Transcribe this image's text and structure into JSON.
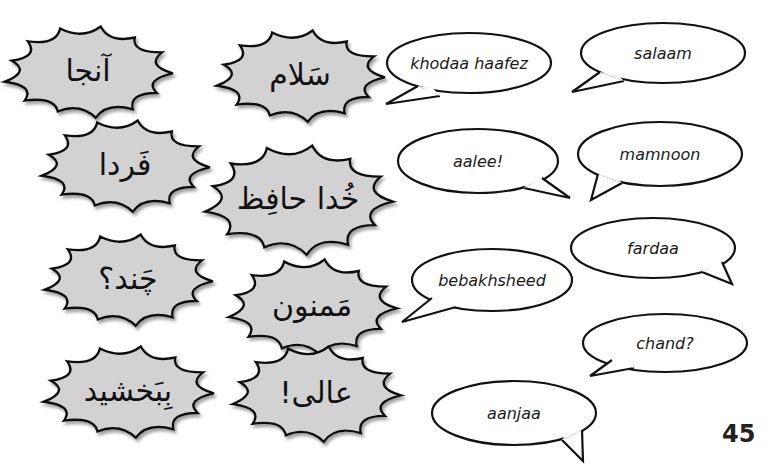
{
  "page": {
    "number": "45",
    "colors": {
      "burst_fill": "#d2d2d2",
      "burst_stroke": "#111111",
      "bubble_fill": "#ffffff",
      "bubble_stroke": "#111111",
      "shadow": "#9a9a9a"
    }
  },
  "farsi_words": [
    {
      "id": "aanjaa",
      "text": "آنجا",
      "cx": 88,
      "cy": 72,
      "w": 170,
      "h": 92
    },
    {
      "id": "salaam",
      "text": "سَلام",
      "cx": 300,
      "cy": 76,
      "w": 170,
      "h": 92
    },
    {
      "id": "fardaa",
      "text": "فَردا",
      "cx": 125,
      "cy": 166,
      "w": 170,
      "h": 92
    },
    {
      "id": "khodaahaafez",
      "text": "خُدا حافِظ",
      "cx": 298,
      "cy": 200,
      "w": 190,
      "h": 110
    },
    {
      "id": "chand",
      "text": "چَند؟",
      "cx": 128,
      "cy": 280,
      "w": 170,
      "h": 92
    },
    {
      "id": "mamnoon",
      "text": "مَمنون",
      "cx": 312,
      "cy": 307,
      "w": 170,
      "h": 96
    },
    {
      "id": "bebakhsheed",
      "text": "بِبَخشید",
      "cx": 128,
      "cy": 392,
      "w": 172,
      "h": 92
    },
    {
      "id": "aalee",
      "text": "عالی!",
      "cx": 316,
      "cy": 394,
      "w": 170,
      "h": 96
    }
  ],
  "transliterations": [
    {
      "id": "khodaa-haafez",
      "text": "khodaa haafez",
      "cx": 469,
      "cy": 63,
      "rx": 82,
      "ry": 30,
      "tail": "lower-left",
      "tip": [
        386,
        104
      ],
      "base1": [
        418,
        86
      ],
      "base2": [
        440,
        96
      ]
    },
    {
      "id": "salaam",
      "text": "salaam",
      "cx": 663,
      "cy": 53,
      "rx": 82,
      "ry": 30,
      "tail": "lower-left",
      "tip": [
        572,
        92
      ],
      "base1": [
        600,
        72
      ],
      "base2": [
        624,
        81
      ]
    },
    {
      "id": "aalee",
      "text": "aalee!",
      "cx": 478,
      "cy": 161,
      "rx": 80,
      "ry": 32,
      "tail": "lower-right",
      "tip": [
        570,
        198
      ],
      "base1": [
        542,
        178
      ],
      "base2": [
        524,
        188
      ]
    },
    {
      "id": "mamnoon",
      "text": "mamnoon",
      "cx": 660,
      "cy": 154,
      "rx": 82,
      "ry": 32,
      "tail": "lower-left",
      "tip": [
        591,
        200
      ],
      "base1": [
        598,
        174
      ],
      "base2": [
        622,
        183
      ]
    },
    {
      "id": "fardaa",
      "text": "fardaa",
      "cx": 653,
      "cy": 248,
      "rx": 82,
      "ry": 30,
      "tail": "lower-right",
      "tip": [
        732,
        284
      ],
      "base1": [
        722,
        262
      ],
      "base2": [
        702,
        272
      ]
    },
    {
      "id": "bebakhsheed",
      "text": "bebakhsheed",
      "cx": 492,
      "cy": 280,
      "rx": 80,
      "ry": 31,
      "tail": "lower-left",
      "tip": [
        402,
        322
      ],
      "base1": [
        432,
        298
      ],
      "base2": [
        456,
        307
      ]
    },
    {
      "id": "chand",
      "text": "chand?",
      "cx": 665,
      "cy": 343,
      "rx": 82,
      "ry": 29,
      "tail": "lower-left",
      "tip": [
        590,
        376
      ],
      "base1": [
        612,
        360
      ],
      "base2": [
        634,
        368
      ]
    },
    {
      "id": "aanjaa",
      "text": "aanjaa",
      "cx": 514,
      "cy": 413,
      "rx": 82,
      "ry": 32,
      "tail": "lower-right",
      "tip": [
        583,
        461
      ],
      "base1": [
        582,
        430
      ],
      "base2": [
        562,
        440
      ]
    }
  ]
}
